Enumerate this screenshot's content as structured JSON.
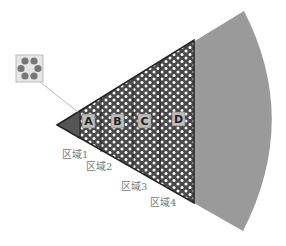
{
  "diagram": {
    "type": "sector-zones",
    "colors": {
      "sector_fill": "#9a9a9a",
      "apex_fill": "#555555",
      "pattern_bg": "#4a4a4a",
      "pattern_dot": "#ffffff",
      "outline": "#222222",
      "label_box": "#bdbdbd",
      "leader_line": "#bbbbbb"
    },
    "zones": [
      {
        "letter": "A",
        "x": 89
      },
      {
        "letter": "B",
        "x": 117
      },
      {
        "letter": "C",
        "x": 145
      },
      {
        "letter": "D",
        "x": 178
      }
    ],
    "region_labels": [
      {
        "text": "区域1",
        "x": 62,
        "y": 158
      },
      {
        "text": "区域2",
        "x": 86,
        "y": 170
      },
      {
        "text": "区域3",
        "x": 121,
        "y": 190
      },
      {
        "text": "区域4",
        "x": 150,
        "y": 206
      }
    ],
    "inset": {
      "name": "pore-detail",
      "description": "magnified ring of six dots"
    }
  }
}
